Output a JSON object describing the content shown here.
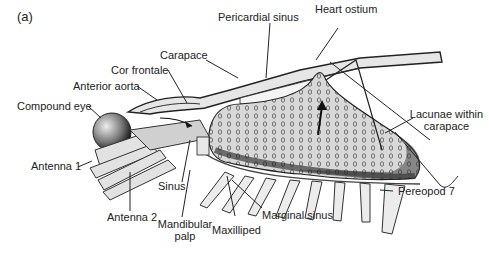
{
  "figure": {
    "panel_label": "(a)",
    "labels": {
      "pericardial_sinus": "Pericardial sinus",
      "heart_ostium": "Heart ostium",
      "carapace": "Carapace",
      "cor_frontale": "Cor frontale",
      "anterior_aorta": "Anterior aorta",
      "compound_eye": "Compound eye",
      "lacunae_line1": "Lacunae within",
      "lacunae_line2": "carapace",
      "antenna_1": "Antenna 1",
      "sinus": "Sinus",
      "antenna_2": "Antenna 2",
      "mandibular_line1": "Mandibular",
      "mandibular_line2": "palp",
      "maxilliped": "Maxilliped",
      "marginal_sinus": "Marginal sinus",
      "pereopod_7": "Pereopod 7"
    }
  }
}
